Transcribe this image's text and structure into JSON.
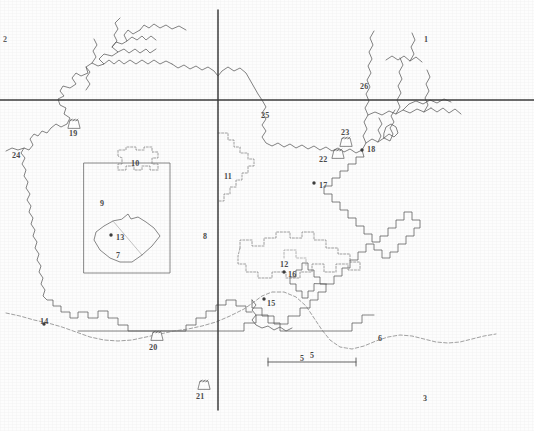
{
  "figure": {
    "kind": "scanned-map",
    "width": 534,
    "height": 431,
    "background_color": "#fdfdfd",
    "ink_color": "#555555",
    "grid_color": "#4a4a4a"
  },
  "scale_bar": {
    "label": "5",
    "x1": 268,
    "x2": 356,
    "y": 360
  },
  "graticule": {
    "horizontal_line_y": 100,
    "vertical_line_x": 218,
    "note": "two heavy reference lines crossing near upper-left-centre"
  },
  "labels": [
    {
      "id": "label-2",
      "text": "2",
      "x": 3,
      "y": 36,
      "style": "faint"
    },
    {
      "id": "label-1",
      "text": "1",
      "x": 424,
      "y": 36,
      "style": "plain"
    },
    {
      "id": "label-26",
      "text": "26",
      "x": 360,
      "y": 83,
      "style": "plain"
    },
    {
      "id": "label-25",
      "text": "25",
      "x": 261,
      "y": 112,
      "style": "plain"
    },
    {
      "id": "label-19",
      "text": "19",
      "x": 69,
      "y": 130,
      "style": "plain"
    },
    {
      "id": "label-23",
      "text": "23",
      "x": 341,
      "y": 129,
      "style": "plain"
    },
    {
      "id": "label-24",
      "text": "24",
      "x": 12,
      "y": 152,
      "style": "plain"
    },
    {
      "id": "label-10",
      "text": "10",
      "x": 131,
      "y": 160,
      "style": "plain"
    },
    {
      "id": "label-22",
      "text": "22",
      "x": 319,
      "y": 156,
      "style": "plain"
    },
    {
      "id": "label-18",
      "text": "18",
      "x": 367,
      "y": 146,
      "style": "plain"
    },
    {
      "id": "label-11",
      "text": "11",
      "x": 224,
      "y": 173,
      "style": "plain"
    },
    {
      "id": "label-17",
      "text": "17",
      "x": 319,
      "y": 182,
      "style": "plain"
    },
    {
      "id": "label-9",
      "text": "9",
      "x": 100,
      "y": 200,
      "style": "plain"
    },
    {
      "id": "label-8",
      "text": "8",
      "x": 203,
      "y": 233,
      "style": "plain"
    },
    {
      "id": "label-13",
      "text": "13",
      "x": 116,
      "y": 234,
      "style": "plain"
    },
    {
      "id": "label-7",
      "text": "7",
      "x": 116,
      "y": 252,
      "style": "plain"
    },
    {
      "id": "label-12",
      "text": "12",
      "x": 280,
      "y": 261,
      "style": "plain"
    },
    {
      "id": "label-16",
      "text": "16",
      "x": 288,
      "y": 271,
      "style": "plain"
    },
    {
      "id": "label-15",
      "text": "15",
      "x": 267,
      "y": 300,
      "style": "plain"
    },
    {
      "id": "label-14",
      "text": "14",
      "x": 40,
      "y": 318,
      "style": "plain"
    },
    {
      "id": "label-6",
      "text": "6",
      "x": 378,
      "y": 335,
      "style": "plain"
    },
    {
      "id": "label-20",
      "text": "20",
      "x": 149,
      "y": 344,
      "style": "plain"
    },
    {
      "id": "label-5",
      "text": "5",
      "x": 300,
      "y": 355,
      "style": "plain"
    },
    {
      "id": "label-21",
      "text": "21",
      "x": 196,
      "y": 393,
      "style": "plain"
    },
    {
      "id": "label-3",
      "text": "3",
      "x": 423,
      "y": 395,
      "style": "plain"
    }
  ],
  "point_markers": [
    {
      "id": "point-18",
      "ref": "18",
      "x": 362,
      "y": 150
    },
    {
      "id": "point-17",
      "ref": "17",
      "x": 314,
      "y": 183
    },
    {
      "id": "point-13",
      "ref": "13",
      "x": 111,
      "y": 235
    },
    {
      "id": "point-16",
      "ref": "16",
      "x": 284,
      "y": 272
    },
    {
      "id": "point-15",
      "ref": "15",
      "x": 264,
      "y": 299
    },
    {
      "id": "point-14",
      "ref": "14",
      "x": 44,
      "y": 324
    }
  ],
  "dam_symbols": [
    {
      "id": "dam-19",
      "ref": "19",
      "x": 73,
      "y": 122
    },
    {
      "id": "dam-23",
      "ref": "23",
      "x": 345,
      "y": 140
    },
    {
      "id": "dam-22",
      "ref": "22",
      "x": 337,
      "y": 151
    },
    {
      "id": "dam-20",
      "ref": "20",
      "x": 156,
      "y": 333
    },
    {
      "id": "dam-21",
      "ref": "21",
      "x": 203,
      "y": 382
    }
  ],
  "regions": [
    {
      "id": "region-9",
      "ref": "9",
      "type": "study-area-square",
      "line": "solid"
    },
    {
      "id": "region-7",
      "ref": "7",
      "type": "inner-polygon",
      "line": "solid"
    },
    {
      "id": "region-10",
      "ref": "10",
      "type": "dashed-outline",
      "line": "dashed"
    },
    {
      "id": "region-11",
      "ref": "11",
      "type": "dashed-outline",
      "line": "dashed"
    },
    {
      "id": "region-12",
      "ref": "12",
      "type": "dashed-outline",
      "line": "dashed"
    },
    {
      "id": "feature-6",
      "ref": "6",
      "type": "dashed-river",
      "line": "dashed"
    }
  ]
}
